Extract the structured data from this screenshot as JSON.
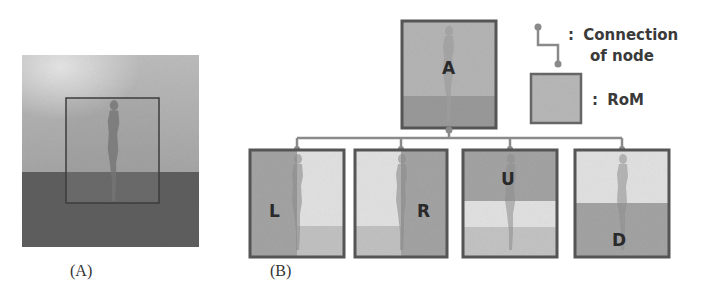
{
  "figure": {
    "panel_a": {
      "label": "(A)",
      "description": "Scene with standing person; RoM bounding box drawn around person"
    },
    "panel_b": {
      "label": "(B)",
      "root_node": {
        "label": "A"
      },
      "child_nodes": [
        {
          "label": "L",
          "split": "left-half"
        },
        {
          "label": "R",
          "split": "right-half"
        },
        {
          "label": "U",
          "split": "upper-half"
        },
        {
          "label": "D",
          "split": "lower-half"
        }
      ],
      "legend": {
        "connection": {
          "colon": ":",
          "line1": "Connection",
          "line2": "of node"
        },
        "rom": {
          "colon": ":",
          "text": "RoM"
        }
      }
    },
    "colors": {
      "node_border": "#5a5a5a",
      "node_fill": "#a9a9a9",
      "connector": "#8a8a8a",
      "sky_light": "#c9c9c9",
      "sky_dark": "#a8a8a8",
      "ground": "#5e5e5e",
      "highlight": "#e4e4e4",
      "shade": "#9c9c9c",
      "figure_silhouette": "#7d7d7d"
    }
  }
}
